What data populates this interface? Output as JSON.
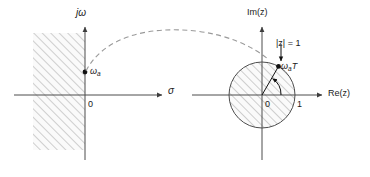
{
  "figure": {
    "type": "diagram",
    "panels": [
      {
        "id": "s-plane",
        "name": "s-plane",
        "axes": {
          "vertical_label": "jω",
          "horizontal_label": "σ",
          "origin_label": "0"
        },
        "region": {
          "name": "left-half-plane-shaded",
          "hatch": "diagonal-45",
          "hatch_color": "#8c8c8c",
          "fill": "#f2f2f2"
        },
        "points": [
          {
            "name": "omega-a-point",
            "label": "ω",
            "subscript": "a",
            "on_axis": "jω"
          }
        ]
      },
      {
        "id": "z-plane",
        "name": "z-plane",
        "axes": {
          "vertical_label": "Im(z)",
          "horizontal_label": "Re(z)",
          "origin_label": "0",
          "unit_label": "1"
        },
        "region": {
          "name": "unit-disk-shaded",
          "hatch": "diagonal-45",
          "hatch_color": "#8c8c8c",
          "fill": "#f2f2f2"
        },
        "annotations": [
          {
            "name": "unit-circle-label",
            "text": "|z| = 1",
            "italic_part": "z"
          },
          {
            "name": "angle-label",
            "label": "ω",
            "subscript": "a",
            "suffix": "T",
            "text": "ωaT"
          }
        ]
      }
    ],
    "mapping_curve": {
      "name": "s-to-z-mapping-arc",
      "style": "dashed",
      "color": "#8c8c8c",
      "from": "omega-a-point",
      "to": "unit-circle-point"
    },
    "colors": {
      "axis": "#4d4d4d",
      "text": "#1a1a1a",
      "hatch": "#8c8c8c",
      "dashed": "#8c8c8c",
      "circle": "#4d4d4d",
      "background": "#ffffff"
    }
  }
}
